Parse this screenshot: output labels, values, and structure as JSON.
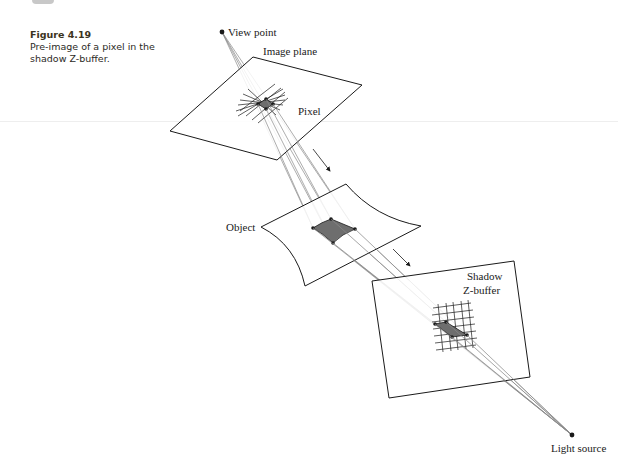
{
  "caption": {
    "figure_number": "Figure 4.19",
    "text": "Pre-image of a pixel in the shadow Z-buffer."
  },
  "diagram": {
    "labels": {
      "view_point": "View point",
      "image_plane": "Image plane",
      "pixel": "Pixel",
      "object": "Object",
      "shadow_zbuffer_line1": "Shadow",
      "shadow_zbuffer_line2": "Z-buffer",
      "light_source": "Light source"
    },
    "colors": {
      "stroke": "#1a1a1a",
      "ray": "#8a8a8a",
      "patch_fill": "#6e6e6e"
    }
  }
}
